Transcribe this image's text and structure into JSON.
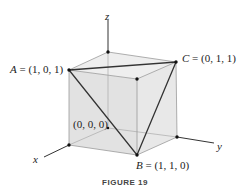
{
  "figure": {
    "caption": "FIGURE 19",
    "axes": {
      "x": "x",
      "y": "y",
      "z": "z"
    },
    "points": {
      "A": {
        "name": "A",
        "coords": "= (1, 0, 1)"
      },
      "B": {
        "name": "B",
        "coords": "= (1, 1, 0)"
      },
      "C": {
        "name": "C",
        "coords": "= (0, 1, 1)"
      },
      "origin": {
        "coords": "(0, 0, 0)"
      }
    },
    "colors": {
      "cube_fill": "#e4e4e4",
      "cube_top": "#ececec",
      "edge": "#9a9a9a",
      "triangle": "#333333",
      "axis": "#333333"
    }
  }
}
